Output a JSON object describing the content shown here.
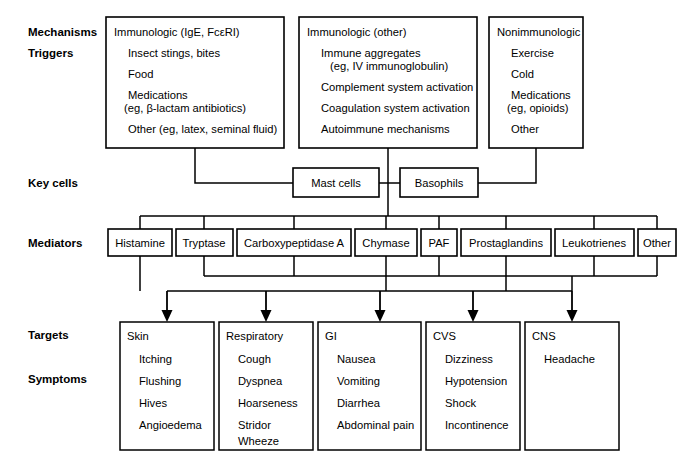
{
  "diagram": {
    "background_color": "#ffffff",
    "line_color": "#000000",
    "text_color": "#000000"
  },
  "row_labels": {
    "mechanisms": "Mechanisms",
    "triggers": "Triggers",
    "key_cells": "Key cells",
    "mediators": "Mediators",
    "targets": "Targets",
    "symptoms": "Symptoms"
  },
  "mechanism_boxes": [
    {
      "id": "immunologic-ige",
      "heading": "Immunologic (IgE, FcεRI)",
      "items": [
        {
          "text": "Insect stings, bites"
        },
        {
          "text": "Food"
        },
        {
          "text": "Medications",
          "sub": "(eg, β-lactam antibiotics)"
        },
        {
          "text": "Other (eg, latex, seminal fluid)"
        }
      ]
    },
    {
      "id": "immunologic-other",
      "heading": "Immunologic (other)",
      "items": [
        {
          "text": "Immune aggregates",
          "sub": "(eg, IV immunoglobulin)"
        },
        {
          "text": "Complement system activation"
        },
        {
          "text": "Coagulation system activation"
        },
        {
          "text": "Autoimmune mechanisms"
        }
      ]
    },
    {
      "id": "nonimmunologic",
      "heading": "Nonimmunologic",
      "items": [
        {
          "text": "Exercise"
        },
        {
          "text": "Cold"
        },
        {
          "text": "Medications",
          "sub": "(eg, opioids)"
        },
        {
          "text": "Other"
        }
      ]
    }
  ],
  "key_cells": [
    {
      "id": "mast-cells",
      "label": "Mast cells"
    },
    {
      "id": "basophils",
      "label": "Basophils"
    }
  ],
  "mediators": [
    {
      "id": "histamine",
      "label": "Histamine"
    },
    {
      "id": "tryptase",
      "label": "Tryptase"
    },
    {
      "id": "carboxypeptidase-a",
      "label": "Carboxypeptidase A"
    },
    {
      "id": "chymase",
      "label": "Chymase"
    },
    {
      "id": "paf",
      "label": "PAF"
    },
    {
      "id": "prostaglandins",
      "label": "Prostaglandins"
    },
    {
      "id": "leukotrienes",
      "label": "Leukotrienes"
    },
    {
      "id": "other",
      "label": "Other"
    }
  ],
  "target_boxes": [
    {
      "id": "skin",
      "heading": "Skin",
      "symptoms": [
        "Itching",
        "Flushing",
        "Hives",
        "Angioedema"
      ]
    },
    {
      "id": "respiratory",
      "heading": "Respiratory",
      "symptoms": [
        "Cough",
        "Dyspnea",
        "Hoarseness",
        "Stridor",
        "Wheeze"
      ]
    },
    {
      "id": "gi",
      "heading": "GI",
      "symptoms": [
        "Nausea",
        "Vomiting",
        "Diarrhea",
        "Abdominal pain"
      ]
    },
    {
      "id": "cvs",
      "heading": "CVS",
      "symptoms": [
        "Dizziness",
        "Hypotension",
        "Shock",
        "Incontinence"
      ]
    },
    {
      "id": "cns",
      "heading": "CNS",
      "symptoms": [
        "Headache"
      ]
    }
  ],
  "layout": {
    "mechanism_boxes": [
      {
        "x": 106,
        "y": 17,
        "w": 178,
        "h": 131
      },
      {
        "x": 299,
        "y": 17,
        "w": 178,
        "h": 131
      },
      {
        "x": 489,
        "y": 17,
        "w": 94,
        "h": 131
      }
    ],
    "key_cell_boxes": [
      {
        "x": 293,
        "y": 168,
        "w": 86,
        "h": 29
      },
      {
        "x": 400,
        "y": 168,
        "w": 78,
        "h": 29
      }
    ],
    "mediator_boxes": [
      {
        "x": 108,
        "y": 229,
        "w": 64,
        "h": 27
      },
      {
        "x": 176,
        "y": 229,
        "w": 57,
        "h": 27
      },
      {
        "x": 237,
        "y": 229,
        "w": 114,
        "h": 27
      },
      {
        "x": 355,
        "y": 229,
        "w": 62,
        "h": 27
      },
      {
        "x": 421,
        "y": 229,
        "w": 36,
        "h": 27
      },
      {
        "x": 461,
        "y": 229,
        "w": 90,
        "h": 27
      },
      {
        "x": 555,
        "y": 229,
        "w": 79,
        "h": 27
      },
      {
        "x": 638,
        "y": 229,
        "w": 38,
        "h": 27
      }
    ],
    "target_boxes": [
      {
        "x": 120,
        "y": 322,
        "w": 94,
        "h": 128
      },
      {
        "x": 219,
        "y": 322,
        "w": 94,
        "h": 128
      },
      {
        "x": 318,
        "y": 322,
        "w": 103,
        "h": 128
      },
      {
        "x": 426,
        "y": 322,
        "w": 94,
        "h": 128
      },
      {
        "x": 525,
        "y": 322,
        "w": 94,
        "h": 128
      }
    ],
    "row_label_positions": {
      "mechanisms": {
        "x": 28,
        "y": 36
      },
      "triggers": {
        "x": 28,
        "y": 57
      },
      "key_cells": {
        "x": 28,
        "y": 187
      },
      "mediators": {
        "x": 28,
        "y": 247
      },
      "targets": {
        "x": 28,
        "y": 339
      },
      "symptoms": {
        "x": 28,
        "y": 383
      }
    }
  }
}
